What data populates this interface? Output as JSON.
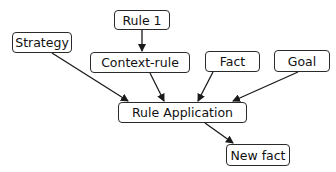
{
  "diagram": {
    "type": "flow",
    "nodes": [
      {
        "id": "strategy",
        "label": "Strategy"
      },
      {
        "id": "rule1",
        "label": "Rule 1"
      },
      {
        "id": "context_rule",
        "label": "Context-rule"
      },
      {
        "id": "fact",
        "label": "Fact"
      },
      {
        "id": "goal",
        "label": "Goal"
      },
      {
        "id": "rule_application",
        "label": "Rule Application"
      },
      {
        "id": "new_fact",
        "label": "New fact"
      }
    ],
    "edges": [
      {
        "from": "rule1",
        "to": "context_rule"
      },
      {
        "from": "strategy",
        "to": "rule_application"
      },
      {
        "from": "context_rule",
        "to": "rule_application"
      },
      {
        "from": "fact",
        "to": "rule_application"
      },
      {
        "from": "goal",
        "to": "rule_application"
      },
      {
        "from": "rule_application",
        "to": "new_fact"
      }
    ],
    "colors": {
      "stroke": "#2a2a2a",
      "background": "#ffffff",
      "text": "#111111"
    }
  }
}
